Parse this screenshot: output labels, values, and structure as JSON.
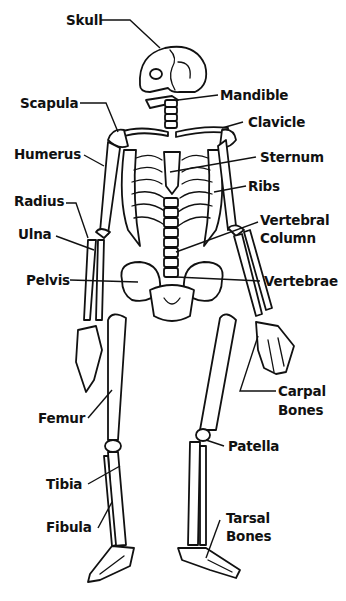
{
  "diagram": {
    "labels": {
      "skull": "Skull",
      "mandible": "Mandible",
      "scapula": "Scapula",
      "clavicle": "Clavicle",
      "humerus": "Humerus",
      "sternum": "Sternum",
      "ribs": "Ribs",
      "radius": "Radius",
      "ulna": "Ulna",
      "vertebral_column_1": "Vertebral",
      "vertebral_column_2": "Column",
      "pelvis": "Pelvis",
      "vertebrae": "Vertebrae",
      "carpal_1": "Carpal",
      "carpal_2": "Bones",
      "femur": "Femur",
      "patella": "Patella",
      "tibia": "Tibia",
      "fibula": "Fibula",
      "tarsal_1": "Tarsal",
      "tarsal_2": "Bones"
    }
  }
}
